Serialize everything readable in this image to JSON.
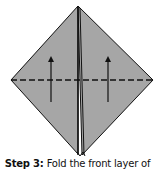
{
  "diagram": {
    "fill_color": "#a6a6a6",
    "stroke_color": "#111111",
    "fold_line": "dashed",
    "arrows": [
      {
        "direction": "up",
        "x": 51
      },
      {
        "direction": "up",
        "x": 108
      }
    ]
  },
  "caption": {
    "step_label": "Step 3:",
    "text": "Fold the front layer of"
  }
}
